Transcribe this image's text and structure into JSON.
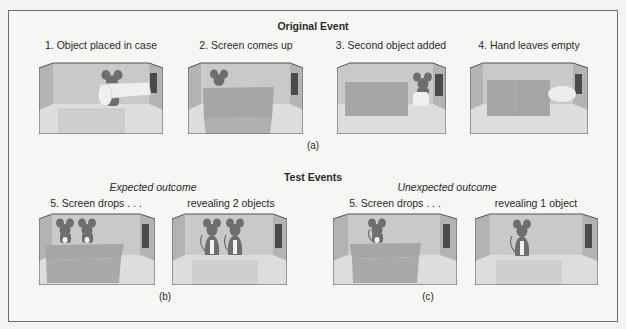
{
  "figure": {
    "original_event": {
      "title": "Original Event",
      "steps": [
        "1. Object placed in case",
        "2. Screen comes up",
        "3. Second object added",
        "4. Hand leaves empty"
      ],
      "sublabel": "(a)"
    },
    "test_events": {
      "title": "Test Events",
      "expected": {
        "heading": "Expected outcome",
        "steps": [
          "5. Screen drops . . .",
          "revealing 2 objects"
        ],
        "sublabel": "(b)"
      },
      "unexpected": {
        "heading": "Unexpected outcome",
        "steps": [
          "5. Screen drops . . .",
          "revealing 1 object"
        ],
        "sublabel": "(c)"
      }
    }
  },
  "colors": {
    "wall": "#c9c9c7",
    "side_wall": "#b3b3b1",
    "floor": "#dddddb",
    "screen": "#a6a6a4",
    "door": "#4a4a48",
    "mouse": "#6e6e6c",
    "outline": "#555555"
  }
}
